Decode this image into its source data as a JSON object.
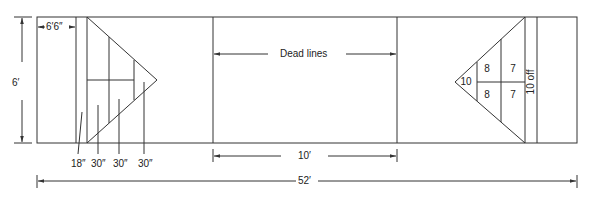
{
  "diagram": {
    "colors": {
      "line": "#333333",
      "text": "#222222",
      "background": "#ffffff"
    },
    "dimensions": {
      "width_label": "6′",
      "lag_area_label": "6′6″",
      "dead_lines_label": "Dead lines",
      "dead_lines_spacing_label": "10′",
      "total_length_label": "52′"
    },
    "left_scoring_triangle": {
      "zone_depths": [
        "18″",
        "30″",
        "30″",
        "30″"
      ]
    },
    "right_scoring_triangle": {
      "tip_score": "10",
      "upper_scores": [
        "8",
        "7"
      ],
      "lower_scores": [
        "8",
        "7"
      ],
      "off_zone_label": "10 off"
    }
  }
}
